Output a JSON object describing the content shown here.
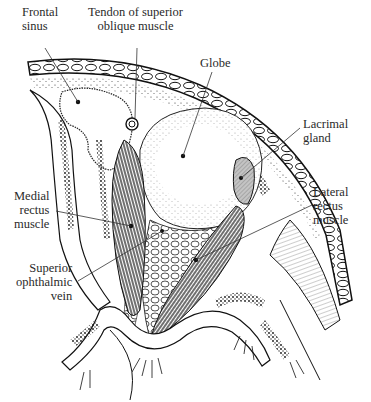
{
  "figure": {
    "colors": {
      "ink": "#1a1a1a",
      "label_text": "#2a2a2a",
      "background": "#ffffff",
      "lacrimal_gland_fill": "#bdbdbd"
    }
  },
  "labels": {
    "frontal_sinus": "Frontal\nsinus",
    "tendon_superior_oblique": "Tendon of superior\noblique muscle",
    "globe": "Globe",
    "lacrimal_gland": "Lacrimal\ngland",
    "medial_rectus": "Medial\nrectus\nmuscle",
    "lateral_rectus": "Lateral\nrectus\nmuscle",
    "superior_ophthalmic_vein": "Superior\nophthalmic\nvein"
  }
}
